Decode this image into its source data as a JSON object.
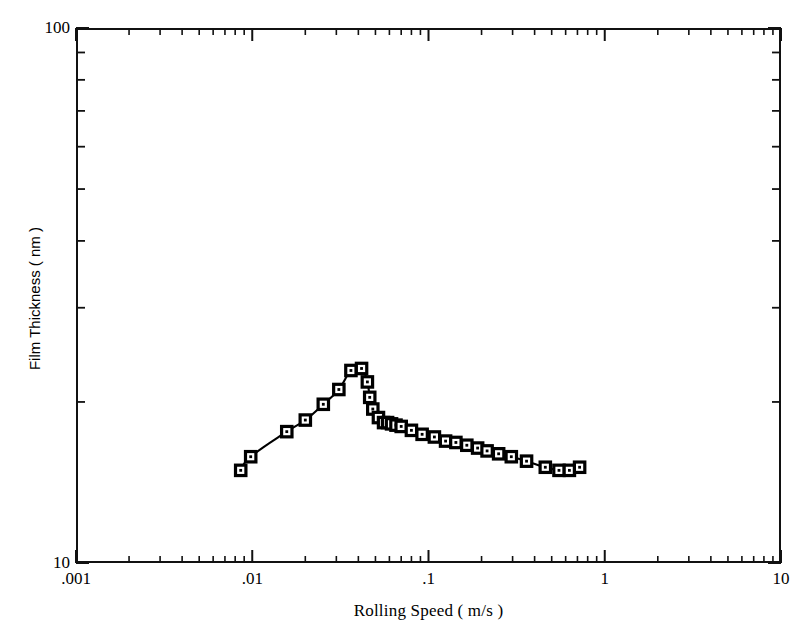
{
  "figure": {
    "background": "#ffffff",
    "frame_color": "#111111",
    "line_color": "#000000",
    "marker_fill": "#ffffff",
    "marker_edge": "#000000"
  },
  "axes": {
    "x": {
      "title": "Rolling Speed     ( m/s )",
      "scale": "log",
      "min": 0.001,
      "max": 10,
      "ticks": [
        {
          "value": 0.001,
          "label": ".001"
        },
        {
          "value": 0.01,
          "label": ".01"
        },
        {
          "value": 0.1,
          "label": ".1"
        },
        {
          "value": 1,
          "label": "1"
        },
        {
          "value": 10,
          "label": "10"
        }
      ]
    },
    "y": {
      "title": "Film Thickness     ( nm )",
      "scale": "log",
      "min": 10,
      "max": 100,
      "ticks": [
        {
          "value": 10,
          "label": "10"
        },
        {
          "value": 100,
          "label": "100"
        }
      ]
    }
  },
  "chart_data": {
    "type": "line",
    "title": "",
    "xlabel": "Rolling Speed     ( m/s )",
    "ylabel": "Film Thickness     ( nm )",
    "xscale": "log",
    "yscale": "log",
    "xlim": [
      0.001,
      10
    ],
    "ylim": [
      10,
      100
    ],
    "grid": false,
    "legend": false,
    "marker": "open-square",
    "series": [
      {
        "name": "Film thickness",
        "x": [
          0.0086,
          0.0098,
          0.0157,
          0.02,
          0.0253,
          0.031,
          0.0363,
          0.0417,
          0.045,
          0.0464,
          0.0483,
          0.052,
          0.0556,
          0.0586,
          0.0617,
          0.0654,
          0.07,
          0.08,
          0.092,
          0.108,
          0.125,
          0.143,
          0.165,
          0.19,
          0.215,
          0.25,
          0.295,
          0.36,
          0.46,
          0.55,
          0.63,
          0.72
        ],
        "y": [
          14.9,
          15.8,
          17.6,
          18.5,
          19.8,
          21.1,
          22.9,
          23.1,
          21.8,
          20.4,
          19.4,
          18.7,
          18.3,
          18.3,
          18.2,
          18.1,
          18.0,
          17.7,
          17.4,
          17.2,
          16.9,
          16.8,
          16.6,
          16.4,
          16.2,
          16.0,
          15.8,
          15.5,
          15.1,
          14.9,
          14.9,
          15.1
        ]
      }
    ]
  }
}
